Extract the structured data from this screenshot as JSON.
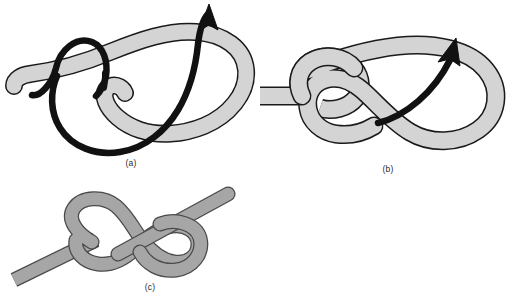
{
  "figure": {
    "background_color": "#ffffff",
    "width": 518,
    "height": 305
  },
  "colors": {
    "band_light_fill": "#d4d4d4",
    "band_light_stroke": "#1a1a1a",
    "band_mid_fill": "#a6a6a6",
    "band_mid_stroke": "#1a1a1a",
    "arrow_color": "#111111",
    "caption_color": "#2b2b2b",
    "background": "#ffffff"
  },
  "panels": [
    {
      "id": "a",
      "caption": "(a)",
      "description": "Loose overhand loop formed in a flat band with a black directional arrow curving up and out through the loop",
      "band_fill": "#d4d4d4",
      "arrow_present": true,
      "arrow_direction": "up-right"
    },
    {
      "id": "b",
      "caption": "(b)",
      "description": "Band threaded through the loop forming a figure-eight, short black arrow indicating the pull direction up and to the right",
      "band_fill": "#d4d4d4",
      "arrow_present": true,
      "arrow_direction": "up-right"
    },
    {
      "id": "c",
      "caption": "(c)",
      "description": "Completed flat figure-eight knot drawn on a diagonal band, no arrow",
      "band_fill": "#a6a6a6",
      "arrow_present": false
    }
  ]
}
